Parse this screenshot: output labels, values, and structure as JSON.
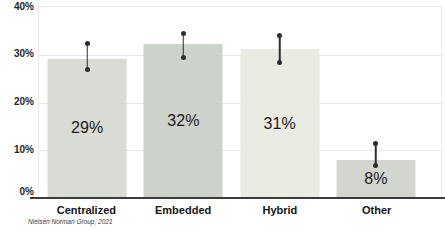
{
  "chart_data": {
    "type": "bar",
    "title": "",
    "xlabel": "",
    "ylabel": "",
    "categories": [
      "Centralized",
      "Embedded",
      "Hybrid",
      "Other"
    ],
    "values": [
      29,
      32,
      31,
      8
    ],
    "value_labels": [
      "29%",
      "32%",
      "31%",
      "8%"
    ],
    "error_low": [
      27,
      29.5,
      28.5,
      7
    ],
    "error_high": [
      32.5,
      34.5,
      34,
      11.5
    ],
    "bar_colors": [
      "#d9dcd5",
      "#cdd2cb",
      "#eaebe3",
      "#d2d6cf"
    ],
    "y_ticks": [
      "40%",
      "30%",
      "20%",
      "10%",
      "0%"
    ],
    "ylim": [
      0,
      40
    ],
    "grid": "horizontal",
    "legend": "none",
    "error_bar_color": "#2d2d2d",
    "axis_line_color": "#3b3b3b",
    "gridline_color": "#e6e6e6",
    "source": "Nielsen Norman Group, 2021"
  }
}
